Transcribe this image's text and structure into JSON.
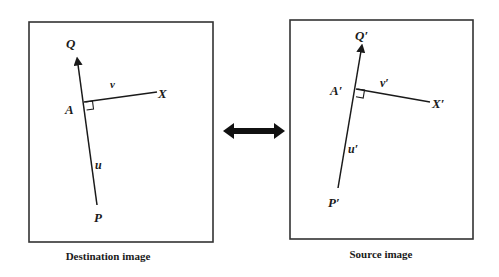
{
  "destination": {
    "caption": "Destination image",
    "labels": {
      "Q": "Q",
      "P": "P",
      "A": "A",
      "X": "X",
      "u": "u",
      "v": "v"
    }
  },
  "source": {
    "caption": "Source image",
    "labels": {
      "Q": "Q′",
      "P": "P′",
      "A": "A′",
      "X": "X′",
      "u": "u′",
      "v": "v′"
    }
  },
  "connector": {
    "type": "double-headed-arrow"
  },
  "colors": {
    "line": "#1a1a1a",
    "frame": "#333333",
    "background": "#ffffff"
  }
}
